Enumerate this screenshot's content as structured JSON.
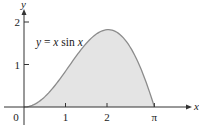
{
  "chart_data": {
    "type": "area",
    "title": "",
    "function_label": "y = x sin x",
    "function_parts": [
      "y",
      " = ",
      "x",
      " sin ",
      "x"
    ],
    "xlabel": "x",
    "ylabel": "y",
    "x_ticks": [
      {
        "value": 0,
        "label": "0"
      },
      {
        "value": 1,
        "label": "1"
      },
      {
        "value": 2,
        "label": "2"
      },
      {
        "value": 3.14159,
        "label": "π"
      }
    ],
    "y_ticks": [
      {
        "value": 1,
        "label": "1"
      },
      {
        "value": 2,
        "label": "2"
      }
    ],
    "xlim": [
      0,
      3.6
    ],
    "ylim": [
      0,
      2.1
    ],
    "grid": false,
    "legend": "none",
    "shaded_region": {
      "from": 0,
      "to": 3.14159,
      "fill": "#e4e4e4"
    },
    "series": [
      {
        "name": "y = x sin x",
        "x": [
          0,
          0.25,
          0.5,
          0.75,
          1.0,
          1.25,
          1.5,
          1.75,
          2.0,
          2.029,
          2.25,
          2.5,
          2.75,
          3.0,
          3.14159
        ],
        "values": [
          0,
          0.062,
          0.24,
          0.511,
          0.841,
          1.186,
          1.496,
          1.722,
          1.819,
          1.82,
          1.751,
          1.496,
          1.052,
          0.423,
          0
        ]
      }
    ],
    "colors": {
      "curve": "#8c8c8c",
      "fill": "#e4e4e4",
      "axis": "#333333"
    }
  }
}
